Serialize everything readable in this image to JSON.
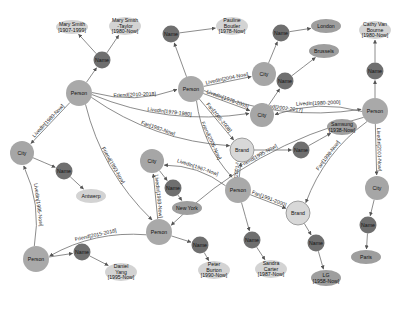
{
  "colors": {
    "person": "#a9a9a9",
    "person_stroke": "#9a9a9a",
    "city": "#a6a6a6",
    "name": "#6f6f6f",
    "brand": "#d8d8d8",
    "brand_stroke": "#8c8c8c",
    "value": "#d3d3d3",
    "value_dark": "#9e9e9e",
    "edge": "#6e6e6e"
  },
  "nodes": [
    {
      "id": "p1",
      "type": "person",
      "label": "Person",
      "x": 79,
      "y": 93,
      "r": 13
    },
    {
      "id": "n1",
      "type": "name",
      "label": "Name",
      "x": 102,
      "y": 60,
      "r": 8.5
    },
    {
      "id": "v1",
      "type": "value",
      "label": "Mary Smith\n[1907-1999]",
      "x": 72,
      "y": 27,
      "rx": 16,
      "ry": 7
    },
    {
      "id": "v2",
      "type": "value",
      "label": "Mary Smith\n-Taylor\n[1980-Now]",
      "x": 125,
      "y": 26,
      "rx": 16,
      "ry": 9
    },
    {
      "id": "p2",
      "type": "person",
      "label": "Person",
      "x": 191,
      "y": 89,
      "r": 13
    },
    {
      "id": "n2",
      "type": "name",
      "label": "Name",
      "x": 171,
      "y": 34,
      "r": 8.5
    },
    {
      "id": "v3",
      "type": "value",
      "label": "Pauline\nBoutler\n[1978-Now]",
      "x": 232,
      "y": 26,
      "rx": 16,
      "ry": 9
    },
    {
      "id": "c1",
      "type": "city",
      "label": "City",
      "x": 264,
      "y": 74,
      "r": 12
    },
    {
      "id": "n3",
      "type": "name",
      "label": "Name",
      "x": 281,
      "y": 33,
      "r": 8.5
    },
    {
      "id": "v4",
      "type": "value_dark",
      "label": "London",
      "x": 326,
      "y": 26,
      "rx": 15,
      "ry": 7
    },
    {
      "id": "v5",
      "type": "value_dark",
      "label": "Brussels",
      "x": 324,
      "y": 51,
      "rx": 15,
      "ry": 7
    },
    {
      "id": "n4",
      "type": "name",
      "label": "Name",
      "x": 285,
      "y": 81,
      "r": 8.5
    },
    {
      "id": "c2",
      "type": "city",
      "label": "City",
      "x": 262,
      "y": 115,
      "r": 12
    },
    {
      "id": "v6",
      "type": "value",
      "label": "Cathy Van\nBourne\n[1980-Now]",
      "x": 375,
      "y": 30,
      "rx": 16,
      "ry": 9
    },
    {
      "id": "n5",
      "type": "name",
      "label": "Name",
      "x": 375,
      "y": 71,
      "r": 8.5
    },
    {
      "id": "p3",
      "type": "person",
      "label": "Person",
      "x": 375,
      "y": 111,
      "r": 13
    },
    {
      "id": "c3",
      "type": "city",
      "label": "City",
      "x": 22,
      "y": 153,
      "r": 12
    },
    {
      "id": "n6",
      "type": "name",
      "label": "Name",
      "x": 64,
      "y": 171,
      "r": 8.5
    },
    {
      "id": "v7",
      "type": "value",
      "label": "Antwerp",
      "x": 91,
      "y": 196,
      "rx": 15,
      "ry": 7
    },
    {
      "id": "b1",
      "type": "brand",
      "label": "Brand",
      "x": 242,
      "y": 150,
      "r": 12
    },
    {
      "id": "n7",
      "type": "name",
      "label": "Name",
      "x": 301,
      "y": 150,
      "r": 8.5
    },
    {
      "id": "v8",
      "type": "value_dark",
      "label": "Samsung\n[1938-Now]",
      "x": 342,
      "y": 127,
      "rx": 15,
      "ry": 8
    },
    {
      "id": "c4",
      "type": "city",
      "label": "City",
      "x": 152,
      "y": 161,
      "r": 12
    },
    {
      "id": "n8",
      "type": "name",
      "label": "Name",
      "x": 173,
      "y": 188,
      "r": 8.5
    },
    {
      "id": "v9",
      "type": "value_dark",
      "label": "New York",
      "x": 187,
      "y": 208,
      "rx": 15,
      "ry": 7
    },
    {
      "id": "p4",
      "type": "person",
      "label": "Person",
      "x": 238,
      "y": 190,
      "r": 13
    },
    {
      "id": "b2",
      "type": "brand",
      "label": "Brand",
      "x": 298,
      "y": 213,
      "r": 12
    },
    {
      "id": "c5",
      "type": "city",
      "label": "City",
      "x": 377,
      "y": 188,
      "r": 12
    },
    {
      "id": "n9",
      "type": "name",
      "label": "Name",
      "x": 368,
      "y": 225,
      "r": 8.5
    },
    {
      "id": "v10",
      "type": "value_dark",
      "label": "Paris",
      "x": 366,
      "y": 257,
      "rx": 15,
      "ry": 7
    },
    {
      "id": "p5",
      "type": "person",
      "label": "Person",
      "x": 159,
      "y": 232,
      "r": 13
    },
    {
      "id": "n10",
      "type": "name",
      "label": "Name",
      "x": 200,
      "y": 245,
      "r": 8.5
    },
    {
      "id": "v11",
      "type": "value",
      "label": "Peter\nBurton\n[1990-Now]",
      "x": 214,
      "y": 270,
      "rx": 16,
      "ry": 9
    },
    {
      "id": "n11",
      "type": "name",
      "label": "Name",
      "x": 252,
      "y": 240,
      "r": 8.5
    },
    {
      "id": "v12",
      "type": "value",
      "label": "Sandra\nCarter\n[1987-Now]",
      "x": 271,
      "y": 269,
      "rx": 16,
      "ry": 9
    },
    {
      "id": "n12",
      "type": "name",
      "label": "Name",
      "x": 316,
      "y": 243,
      "r": 8.5
    },
    {
      "id": "v13",
      "type": "value_dark",
      "label": "LG\n[1958-Now]",
      "x": 326,
      "y": 278,
      "rx": 15,
      "ry": 8
    },
    {
      "id": "p6",
      "type": "person",
      "label": "Person",
      "x": 36,
      "y": 259,
      "r": 13
    },
    {
      "id": "n13",
      "type": "name",
      "label": "Name",
      "x": 82,
      "y": 252,
      "r": 8.5
    },
    {
      "id": "v14",
      "type": "value",
      "label": "Daniel\nYang\n[1995-Now]",
      "x": 121,
      "y": 272,
      "rx": 16,
      "ry": 9
    }
  ],
  "edges": [
    {
      "from": "p1",
      "to": "n1",
      "label": ""
    },
    {
      "from": "n1",
      "to": "v1",
      "label": ""
    },
    {
      "from": "n1",
      "to": "v2",
      "label": ""
    },
    {
      "from": "p1",
      "to": "p2",
      "label": "Friend[2010-2018]"
    },
    {
      "from": "p1",
      "to": "c2",
      "label": "LivedIn[1979-1980]"
    },
    {
      "from": "p1",
      "to": "c3",
      "label": "LivedIn[1980-Now]"
    },
    {
      "from": "p1",
      "to": "b1",
      "label": "Fan[1982-Now]"
    },
    {
      "from": "p1",
      "to": "p5",
      "label": "Friend[1993-Now]"
    },
    {
      "from": "p2",
      "to": "n2",
      "label": ""
    },
    {
      "from": "n2",
      "to": "v3",
      "label": ""
    },
    {
      "from": "p2",
      "to": "c1",
      "label": "LivedIn[2004-Now]"
    },
    {
      "from": "p2",
      "to": "c2",
      "label": "LivedIn[1978-2003]"
    },
    {
      "from": "p2",
      "to": "p3",
      "label": "Friend[2002-2017]"
    },
    {
      "from": "p2",
      "to": "b1",
      "label": "Fan[2005-2008]"
    },
    {
      "from": "p2",
      "to": "p4",
      "label": "Friend[2005-Now]"
    },
    {
      "from": "c1",
      "to": "n3",
      "label": ""
    },
    {
      "from": "n3",
      "to": "v4",
      "label": ""
    },
    {
      "from": "c2",
      "to": "n4",
      "label": ""
    },
    {
      "from": "n4",
      "to": "v5",
      "label": ""
    },
    {
      "from": "p3",
      "to": "c2",
      "label": "LivedIn[1980-2000]"
    },
    {
      "from": "p3",
      "to": "n5",
      "label": ""
    },
    {
      "from": "n5",
      "to": "v6",
      "label": ""
    },
    {
      "from": "p3",
      "to": "c5",
      "label": "LivedIn[2001-Now]"
    },
    {
      "from": "p3",
      "to": "b2",
      "label": "Fan[1998-Now]"
    },
    {
      "from": "p3",
      "to": "p5",
      "label": "Friend[1995-Now]"
    },
    {
      "from": "c3",
      "to": "n6",
      "label": ""
    },
    {
      "from": "n6",
      "to": "v7",
      "label": ""
    },
    {
      "from": "b1",
      "to": "n7",
      "label": ""
    },
    {
      "from": "n7",
      "to": "v8",
      "label": ""
    },
    {
      "from": "p4",
      "to": "b1",
      "label": "Fan[2001-Now]"
    },
    {
      "from": "p4",
      "to": "b2",
      "label": "Fan[1991-2000]"
    },
    {
      "from": "p4",
      "to": "c4",
      "label": "LivedIn[1967-Now]"
    },
    {
      "from": "p4",
      "to": "n11",
      "label": ""
    },
    {
      "from": "n11",
      "to": "v12",
      "label": ""
    },
    {
      "from": "c4",
      "to": "n8",
      "label": ""
    },
    {
      "from": "n8",
      "to": "v9",
      "label": ""
    },
    {
      "from": "p5",
      "to": "c4",
      "label": "LivedIn[1993-Now]"
    },
    {
      "from": "p5",
      "to": "n10",
      "label": ""
    },
    {
      "from": "n10",
      "to": "v11",
      "label": ""
    },
    {
      "from": "p5",
      "to": "p6",
      "label": "Friend[2015-2018]"
    },
    {
      "from": "p6",
      "to": "c3",
      "label": "LivedIn[1995-Now]"
    },
    {
      "from": "p6",
      "to": "n13",
      "label": ""
    },
    {
      "from": "n13",
      "to": "v14",
      "label": ""
    },
    {
      "from": "c5",
      "to": "n9",
      "label": ""
    },
    {
      "from": "n9",
      "to": "v10",
      "label": ""
    },
    {
      "from": "b2",
      "to": "n12",
      "label": ""
    },
    {
      "from": "n12",
      "to": "v13",
      "label": ""
    }
  ]
}
